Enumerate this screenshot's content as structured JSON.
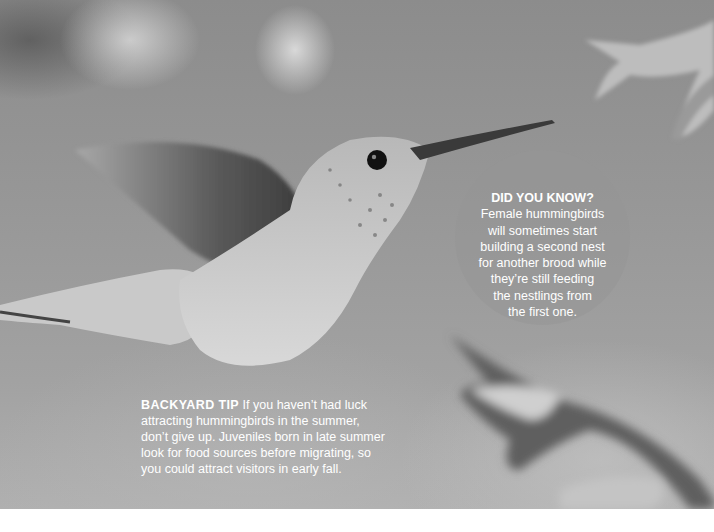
{
  "photo": {
    "subject": "hummingbird in flight",
    "description": "Grayscale photo of a hovering hummingbird with blurred wings approaching a tubular flower"
  },
  "did_you_know": {
    "heading": "DID YOU KNOW?",
    "lines": [
      "Female hummingbirds",
      "will sometimes start",
      "building a second nest",
      "for another brood while",
      "they’re still feeding",
      "the nestlings from",
      "the first one."
    ]
  },
  "backyard_tip": {
    "label": "BACKYARD TIP",
    "text": " If you haven’t had luck attracting hummingbirds in the summer, don’t give up. Juveniles born in late summer look for food sources before migrating, so you could attract visitors in early fall."
  },
  "colors": {
    "text": "#ffffff",
    "background_photo": "#9a9a9a",
    "page": "#ffffff"
  }
}
